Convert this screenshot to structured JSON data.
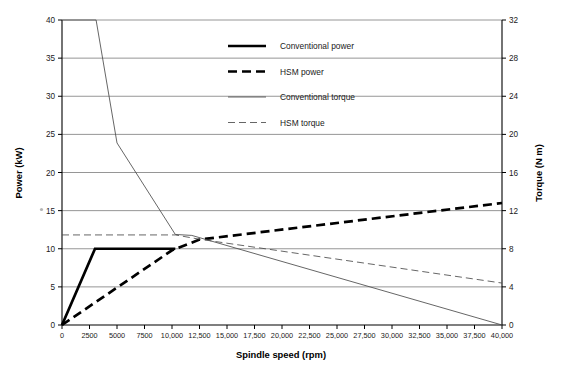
{
  "chart_data": {
    "type": "line",
    "title": "",
    "xlabel": "Spindle speed (rpm)",
    "ylabel": "Power (kW)",
    "y2label": "Torque (N m)",
    "xlim": [
      0,
      40000
    ],
    "ylim": [
      0,
      40
    ],
    "y2lim": [
      0,
      32
    ],
    "grid": true,
    "legend_position": "top-center",
    "xticks": [
      0,
      2500,
      5000,
      7500,
      10000,
      12500,
      15000,
      17500,
      20000,
      22500,
      25000,
      27500,
      30000,
      32500,
      35000,
      37500,
      40000
    ],
    "xtick_labels": [
      "0",
      "2500",
      "5000",
      "7500",
      "10,000",
      "12,500",
      "15,000",
      "17,500",
      "20,000",
      "22,500",
      "25,000",
      "27,500",
      "30,000",
      "32,500",
      "35,000",
      "37,500",
      "40,000"
    ],
    "yticks": [
      0,
      5,
      10,
      15,
      20,
      25,
      30,
      35,
      40
    ],
    "ytick_labels": [
      "0",
      "5",
      "10",
      "15",
      "20",
      "25",
      "30",
      "35",
      "40"
    ],
    "y2ticks": [
      0,
      4,
      8,
      12,
      16,
      20,
      24,
      28,
      32
    ],
    "y2tick_labels": [
      "0",
      "4",
      "8",
      "12",
      "16",
      "20",
      "24",
      "28",
      "32"
    ],
    "series": [
      {
        "name": "Conventional power",
        "axis": "left",
        "unit": "kW",
        "style": "thick-solid",
        "color": "#000000",
        "points": [
          [
            0,
            0
          ],
          [
            3000,
            10
          ],
          [
            10300,
            10
          ]
        ]
      },
      {
        "name": "HSM power",
        "axis": "left",
        "unit": "kW",
        "style": "thick-dashed",
        "color": "#000000",
        "points": [
          [
            0,
            0
          ],
          [
            10000,
            9.8
          ],
          [
            12500,
            11.2
          ],
          [
            40000,
            16
          ]
        ]
      },
      {
        "name": "Conventional torque",
        "axis": "right",
        "unit": "N m",
        "style": "thin-solid",
        "color": "#4a4a4a",
        "points": [
          [
            0,
            32
          ],
          [
            3100,
            32
          ],
          [
            5000,
            19.1
          ],
          [
            10300,
            9.5
          ],
          [
            11800,
            9.4
          ],
          [
            40000,
            0
          ]
        ]
      },
      {
        "name": "HSM torque",
        "axis": "right",
        "unit": "N m",
        "style": "thin-dashed",
        "color": "#4a4a4a",
        "points": [
          [
            0,
            9.45
          ],
          [
            10300,
            9.45
          ],
          [
            12500,
            9.0
          ],
          [
            40000,
            4.4
          ]
        ]
      }
    ],
    "legend": [
      {
        "label": "Conventional power",
        "style": "thick-solid"
      },
      {
        "label": "HSM power",
        "style": "thick-dashed"
      },
      {
        "label": "Conventional torque",
        "style": "thin-solid"
      },
      {
        "label": "HSM torque",
        "style": "thin-dashed"
      }
    ]
  }
}
